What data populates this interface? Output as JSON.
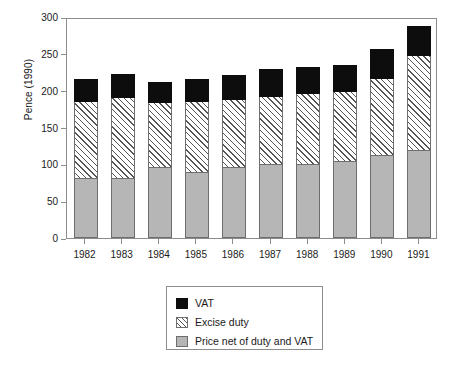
{
  "chart_data": {
    "type": "bar",
    "subtype": "stacked-vertical",
    "title": "",
    "xlabel": "",
    "ylabel": "Pence (1990)",
    "categories": [
      "1982",
      "1983",
      "1984",
      "1985",
      "1986",
      "1987",
      "1988",
      "1989",
      "1990",
      "1991"
    ],
    "series": [
      {
        "name": "Price net of duty and VAT",
        "color": "#b6b6b6",
        "fill": "solid-grey",
        "values": [
          82,
          82,
          96,
          89,
          96,
          101,
          101,
          105,
          113,
          120
        ]
      },
      {
        "name": "Excise duty",
        "color": "#ffffff",
        "fill": "diagonal-hatch",
        "values": [
          106,
          111,
          90,
          99,
          94,
          93,
          97,
          96,
          106,
          130
        ]
      },
      {
        "name": "VAT",
        "color": "#0d0d0d",
        "fill": "solid-black",
        "values": [
          30,
          32,
          28,
          31,
          34,
          38,
          37,
          36,
          40,
          41
        ]
      }
    ],
    "stack_totals": [
      218,
      225,
      214,
      219,
      224,
      232,
      235,
      237,
      259,
      291
    ],
    "ylim": [
      0,
      300
    ],
    "yticks": [
      0,
      50,
      100,
      150,
      200,
      250,
      300
    ],
    "ytick_labels": [
      "0",
      "50",
      "100",
      "150",
      "200",
      "250",
      "300"
    ],
    "grid": false,
    "legend_position": "below-axes-center",
    "legend_entries": [
      {
        "label": "VAT",
        "swatch": "solid-black"
      },
      {
        "label": "Excise duty",
        "swatch": "diagonal-hatch"
      },
      {
        "label": "Price net of duty and VAT",
        "swatch": "solid-grey"
      }
    ]
  },
  "axis": {
    "y_title": "Pence (1990)"
  }
}
